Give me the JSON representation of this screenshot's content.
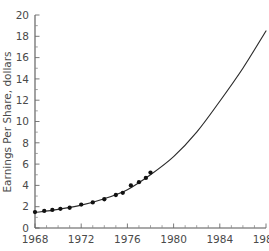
{
  "chart_data": {
    "type": "scatter",
    "title": "",
    "subtitle": "",
    "xlabel": "",
    "ylabel": "Earnings Per Share, dollars",
    "xlim": [
      1968,
      1988
    ],
    "ylim": [
      0,
      20
    ],
    "grid": false,
    "legend": null,
    "x_ticks": [
      1968,
      1972,
      1976,
      1980,
      1984,
      1988
    ],
    "x_tick_labels": [
      "1968",
      "1972",
      "1976",
      "1980",
      "1984",
      "1988"
    ],
    "x_minor_tick_interval": 1,
    "y_ticks": [
      0,
      2,
      4,
      6,
      8,
      10,
      12,
      14,
      16,
      18,
      20
    ],
    "y_tick_labels": [
      "0",
      "2",
      "4",
      "6",
      "8",
      "10",
      "12",
      "14",
      "16",
      "18",
      "20"
    ],
    "y_minor_tick_interval": 1,
    "series": [
      {
        "name": "Observed earnings per share",
        "type": "scatter",
        "marker": "filled-circle",
        "color": "#111111",
        "x": [
          1968,
          1968.8,
          1969.5,
          1970.2,
          1971,
          1972,
          1973,
          1974,
          1975,
          1975.6,
          1976.3,
          1977,
          1977.6,
          1978
        ],
        "values": [
          1.5,
          1.6,
          1.7,
          1.8,
          1.9,
          2.2,
          2.4,
          2.7,
          3.1,
          3.3,
          4.0,
          4.3,
          4.7,
          5.2
        ]
      },
      {
        "name": "Exponential fit (extrapolated)",
        "type": "line",
        "color": "#2b2b2b",
        "x": [
          1968,
          1970,
          1972,
          1974,
          1976,
          1978,
          1980,
          1982,
          1984,
          1986,
          1988
        ],
        "values": [
          1.45,
          1.75,
          2.15,
          2.75,
          3.6,
          5.0,
          6.7,
          9.0,
          11.9,
          15.0,
          18.5
        ]
      }
    ]
  },
  "axes": {
    "y_axis_title": "Earnings Per Share, dollars"
  }
}
